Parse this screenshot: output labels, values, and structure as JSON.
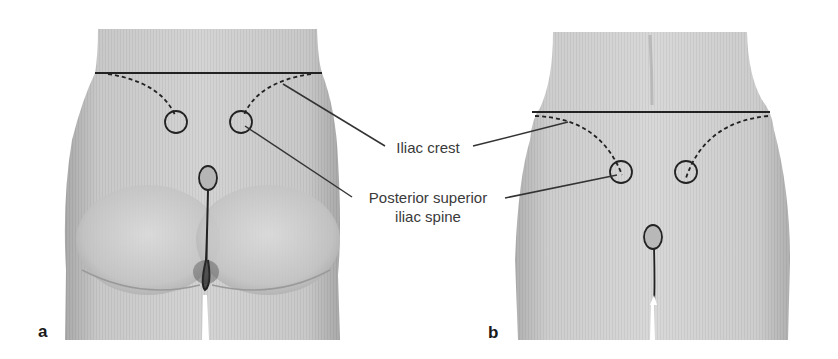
{
  "figure": {
    "panels": [
      {
        "id": "a",
        "label": "a",
        "view": "posterior view of lower back and buttocks (male)"
      },
      {
        "id": "b",
        "label": "b",
        "view": "posterior view of lower back and buttocks (female)"
      }
    ],
    "annotations": {
      "iliac_crest": "Iliac crest",
      "psis_line1": "Posterior superior",
      "psis_line2": "iliac spine"
    },
    "colors": {
      "skin_light": "#d6d6d6",
      "skin_mid": "#bdbdbd",
      "skin_dark": "#8a8a8a",
      "line": "#222222",
      "text": "#3a3a3a"
    }
  }
}
